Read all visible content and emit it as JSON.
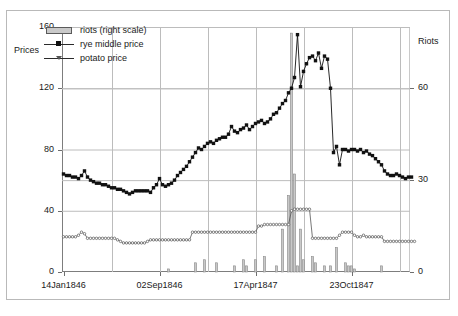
{
  "axes": {
    "y_left_title": "Prices",
    "y_right_title": "Riots",
    "y_left_ticks": [
      "0",
      "40",
      "80",
      "120",
      "160"
    ],
    "y_right_ticks": [
      "0",
      "30",
      "60"
    ],
    "x_ticks": [
      "14Jan1846",
      "02Sep1846",
      "17Apr1847",
      "23Oct1847"
    ]
  },
  "legend": {
    "items": [
      {
        "label": "riots (right scale)",
        "key": "bar-swatch",
        "color": "#c9c9c9"
      },
      {
        "label": "rye middle price",
        "key": "line-square-marker",
        "color": "#111111"
      },
      {
        "label": "potato price",
        "key": "line-triangle-marker",
        "color": "#555555"
      }
    ]
  },
  "chart_data": {
    "type": "line",
    "title": "",
    "xlabel": "",
    "ylabel": "Prices",
    "y2label": "Riots",
    "ylim": [
      0,
      160
    ],
    "y2lim": [
      0,
      80
    ],
    "grid": true,
    "legend_position": "upper-left-inside",
    "x_tick_labels": [
      "14Jan1846",
      "02Sep1846",
      "17Apr1847",
      "23Oct1847"
    ],
    "x_tick_positions": [
      0,
      32,
      64,
      96
    ],
    "n_points": 116,
    "series": [
      {
        "name": "rye middle price",
        "type": "line",
        "axis": "left",
        "marker": "square",
        "color": "#111111",
        "values": [
          64,
          63,
          63,
          62,
          62,
          61,
          63,
          66,
          62,
          60,
          59,
          58,
          58,
          57,
          57,
          56,
          55,
          55,
          54,
          54,
          53,
          52,
          51,
          52,
          53,
          53,
          53,
          53,
          53,
          52,
          55,
          57,
          61,
          57,
          56,
          57,
          58,
          60,
          63,
          65,
          67,
          69,
          72,
          75,
          78,
          81,
          80,
          82,
          84,
          85,
          84,
          86,
          87,
          88,
          88,
          90,
          95,
          92,
          91,
          93,
          94,
          96,
          93,
          95,
          97,
          98,
          99,
          97,
          98,
          100,
          103,
          104,
          107,
          110,
          112,
          117,
          120,
          127,
          155,
          121,
          131,
          136,
          140,
          141,
          138,
          143,
          133,
          141,
          139,
          120,
          78,
          82,
          70,
          80,
          80,
          79,
          80,
          80,
          79,
          80,
          78,
          79,
          77,
          76,
          74,
          72,
          70,
          66,
          64,
          63,
          63,
          64,
          63,
          62,
          61,
          62,
          62
        ]
      },
      {
        "name": "potato price",
        "type": "line",
        "axis": "left",
        "marker": "triangle",
        "color": "#555555",
        "values": [
          23,
          23,
          23,
          23,
          23,
          24,
          26,
          25,
          22,
          22,
          22,
          22,
          22,
          22,
          22,
          22,
          22,
          22,
          21,
          20,
          19,
          19,
          19,
          19,
          19,
          19,
          19,
          19,
          20,
          21,
          21,
          21,
          21,
          21,
          21,
          21,
          21,
          21,
          21,
          21,
          21,
          21,
          21,
          26,
          26,
          26,
          26,
          26,
          26,
          26,
          26,
          26,
          26,
          26,
          26,
          26,
          26,
          26,
          26,
          26,
          26,
          26,
          26,
          26,
          26,
          30,
          30,
          31,
          31,
          31,
          31,
          31,
          31,
          31,
          31,
          31,
          40,
          41,
          41,
          41,
          41,
          41,
          41,
          22,
          22,
          22,
          22,
          22,
          22,
          22,
          22,
          22,
          24,
          26,
          26,
          26,
          26,
          24,
          23,
          23,
          24,
          23,
          23,
          23,
          23,
          23,
          23,
          20,
          20,
          20,
          20,
          20,
          20,
          20,
          20,
          20,
          20,
          20
        ]
      },
      {
        "name": "riots (right scale)",
        "type": "bar",
        "axis": "right",
        "color": "#c9c9c9",
        "values": [
          0,
          0,
          0,
          0,
          0,
          0,
          0,
          0,
          0,
          0,
          0,
          0,
          0,
          0,
          0,
          0,
          0,
          0,
          0,
          0,
          0,
          0,
          0,
          0,
          0,
          0,
          0,
          0,
          0,
          0,
          0,
          0,
          0,
          0,
          0,
          1,
          0,
          0,
          0,
          0,
          0,
          0,
          0,
          0,
          3,
          0,
          0,
          4,
          0,
          0,
          0,
          3,
          0,
          0,
          0,
          0,
          0,
          2,
          0,
          0,
          4,
          2,
          0,
          0,
          4,
          0,
          0,
          5,
          0,
          0,
          0,
          2,
          0,
          14,
          0,
          25,
          78,
          32,
          2,
          14,
          4,
          0,
          0,
          5,
          3,
          0,
          0,
          2,
          0,
          2,
          0,
          8,
          0,
          0,
          3,
          2,
          2,
          1,
          0,
          0,
          0,
          0,
          0,
          0,
          0,
          0,
          2,
          0,
          0,
          0,
          0,
          0,
          0,
          0,
          0,
          0,
          0
        ]
      }
    ]
  }
}
